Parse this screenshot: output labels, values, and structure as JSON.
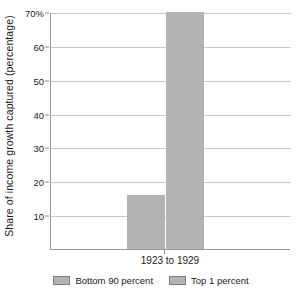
{
  "chart_data": {
    "type": "bar",
    "title": "",
    "xlabel": "",
    "ylabel": "Share of income growth captured (percentage)",
    "categories": [
      "1923 to 1929"
    ],
    "series": [
      {
        "name": "Bottom 90 percent",
        "values": [
          16
        ]
      },
      {
        "name": "Top 1 percent",
        "values": [
          70
        ]
      }
    ],
    "ylim": [
      0,
      70
    ],
    "yticks": [
      10,
      20,
      30,
      40,
      50,
      60,
      70
    ],
    "ytick_labels": [
      "10",
      "20",
      "30",
      "40",
      "50",
      "60",
      "70%"
    ],
    "grid": "horizontal",
    "legend_position": "bottom",
    "colors": {
      "bar_fill": "#b3b3b3",
      "gridline": "#c9c9c9",
      "axis": "#9a9a9a",
      "text": "#1a1a1a",
      "background": "#ffffff"
    }
  },
  "axis": {
    "y_title": "Share of income growth captured (percentage)",
    "x_category": "1923 to 1929",
    "ticks": [
      {
        "label": "70%",
        "value": 70
      },
      {
        "label": "60",
        "value": 60
      },
      {
        "label": "50",
        "value": 50
      },
      {
        "label": "40",
        "value": 40
      },
      {
        "label": "30",
        "value": 30
      },
      {
        "label": "20",
        "value": 20
      },
      {
        "label": "10",
        "value": 10
      }
    ]
  },
  "legend": {
    "items": [
      {
        "label": "Bottom 90 percent",
        "color": "#b3b3b3"
      },
      {
        "label": "Top 1 percent",
        "color": "#b3b3b3"
      }
    ]
  }
}
